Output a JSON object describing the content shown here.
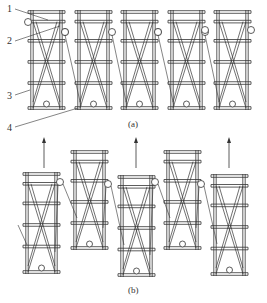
{
  "figure": {
    "panel_a": {
      "caption": "(a)",
      "frames": [
        {
          "x": 32,
          "top": 12,
          "bottom": 108
        },
        {
          "x": 79,
          "top": 12,
          "bottom": 108
        },
        {
          "x": 125,
          "top": 12,
          "bottom": 108
        },
        {
          "x": 172,
          "top": 12,
          "bottom": 108
        },
        {
          "x": 218,
          "top": 12,
          "bottom": 108
        }
      ],
      "callouts": [
        {
          "label": "1",
          "x": 7,
          "y": 4
        },
        {
          "label": "2",
          "x": 7,
          "y": 36
        },
        {
          "label": "3",
          "x": 7,
          "y": 91
        },
        {
          "label": "4",
          "x": 7,
          "y": 123
        }
      ]
    },
    "panel_b": {
      "caption": "(b)",
      "frames": [
        {
          "x": 27,
          "top": 174,
          "bottom": 272
        },
        {
          "x": 75,
          "top": 152,
          "bottom": 248
        },
        {
          "x": 122,
          "top": 177,
          "bottom": 275
        },
        {
          "x": 168,
          "top": 152,
          "bottom": 248
        },
        {
          "x": 215,
          "top": 176,
          "bottom": 274
        }
      ],
      "arrows": [
        {
          "x": 44,
          "y1": 168,
          "y2": 140
        },
        {
          "x": 136,
          "y1": 168,
          "y2": 140
        },
        {
          "x": 229,
          "y1": 168,
          "y2": 140
        }
      ]
    },
    "colors": {
      "line": "#333333",
      "background": "#ffffff"
    }
  }
}
